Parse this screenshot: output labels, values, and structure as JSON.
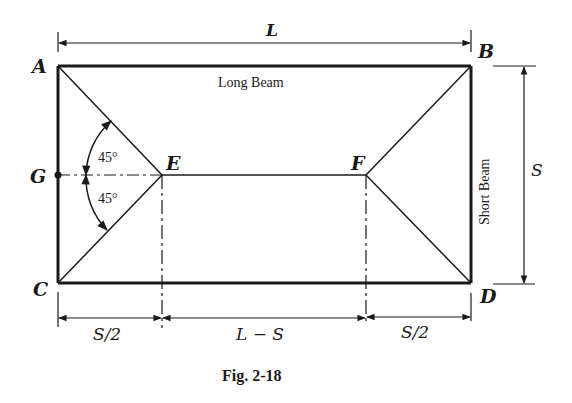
{
  "figure": {
    "caption": "Fig. 2-18",
    "points": {
      "A": "A",
      "B": "B",
      "C": "C",
      "D": "D",
      "E": "E",
      "F": "F",
      "G": "G"
    },
    "beams": {
      "long": "Long Beam",
      "short": "Short Beam"
    },
    "dimensions": {
      "top": "L",
      "right": "S",
      "bottom_left": "S/2",
      "bottom_middle": "L − S",
      "bottom_right": "S/2"
    },
    "angles": {
      "upper": "45°",
      "lower": "45°"
    },
    "colors": {
      "ink": "#1a1a1a",
      "background": "#ffffff"
    }
  }
}
